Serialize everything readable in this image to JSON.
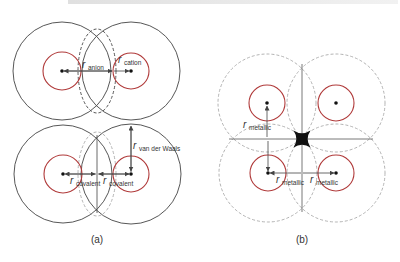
{
  "colors": {
    "outer_circle": "#444444",
    "dashed_circle": "#aaaaaa",
    "inner_circle": "#b03a3a",
    "arrow": "#444444",
    "label": "#333333"
  },
  "panel_a": {
    "caption": "(a)",
    "labels": {
      "r": "r",
      "anion": "anion",
      "cation": "cation",
      "van_der_waals": "van der Waals",
      "covalent_left": "covalent",
      "covalent_right": "covalent"
    }
  },
  "panel_b": {
    "caption": "(b)",
    "labels": {
      "r": "r",
      "metallic_vertical": "metallic",
      "metallic_left": "metallic",
      "metallic_right": "metallic"
    }
  }
}
